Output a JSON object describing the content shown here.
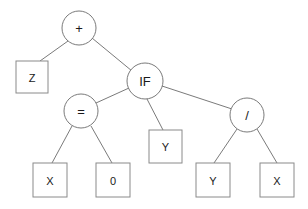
{
  "diagram": {
    "type": "expression-tree",
    "colors": {
      "background": "#ffffff",
      "edge_stroke": "#6b6b6b",
      "circle_stroke": "#6b6b6b",
      "rect_stroke": "#8a8a8a",
      "text": "#1a1a1a"
    },
    "nodes": [
      {
        "id": "plus",
        "label": "+",
        "shape": "circle",
        "cx": 79,
        "cy": 28,
        "r": 17
      },
      {
        "id": "z",
        "label": "Z",
        "shape": "rect",
        "x": 16,
        "y": 61,
        "w": 32,
        "h": 32
      },
      {
        "id": "if",
        "label": "IF",
        "shape": "circle",
        "cx": 145,
        "cy": 81,
        "r": 18
      },
      {
        "id": "equals",
        "label": "=",
        "shape": "circle",
        "cx": 81,
        "cy": 111,
        "r": 17
      },
      {
        "id": "ymid",
        "label": "Y",
        "shape": "rect",
        "x": 149,
        "y": 130,
        "w": 33,
        "h": 33
      },
      {
        "id": "divide",
        "label": "/",
        "shape": "circle",
        "cx": 247,
        "cy": 115,
        "r": 17
      },
      {
        "id": "x1",
        "label": "X",
        "shape": "rect",
        "x": 33,
        "y": 163,
        "w": 34,
        "h": 34
      },
      {
        "id": "zero",
        "label": "0",
        "shape": "rect",
        "x": 96,
        "y": 163,
        "w": 34,
        "h": 34
      },
      {
        "id": "y2",
        "label": "Y",
        "shape": "rect",
        "x": 196,
        "y": 163,
        "w": 34,
        "h": 34
      },
      {
        "id": "x2",
        "label": "X",
        "shape": "rect",
        "x": 260,
        "y": 163,
        "w": 34,
        "h": 34
      }
    ],
    "edges": [
      {
        "from": "plus",
        "to": "z",
        "x1": 68,
        "y1": 41,
        "x2": 40,
        "y2": 61
      },
      {
        "from": "plus",
        "to": "if",
        "x1": 92,
        "y1": 38,
        "x2": 132,
        "y2": 71
      },
      {
        "from": "if",
        "to": "equals",
        "x1": 129,
        "y1": 88,
        "x2": 96,
        "y2": 103
      },
      {
        "from": "if",
        "to": "ymid",
        "x1": 147,
        "y1": 99,
        "x2": 163,
        "y2": 130
      },
      {
        "from": "if",
        "to": "divide",
        "x1": 162,
        "y1": 86,
        "x2": 232,
        "y2": 109
      },
      {
        "from": "equals",
        "to": "x1",
        "x1": 72,
        "y1": 126,
        "x2": 52,
        "y2": 163
      },
      {
        "from": "equals",
        "to": "zero",
        "x1": 91,
        "y1": 126,
        "x2": 112,
        "y2": 163
      },
      {
        "from": "divide",
        "to": "y2",
        "x1": 237,
        "y1": 129,
        "x2": 214,
        "y2": 163
      },
      {
        "from": "divide",
        "to": "x2",
        "x1": 257,
        "y1": 129,
        "x2": 277,
        "y2": 163
      }
    ]
  }
}
